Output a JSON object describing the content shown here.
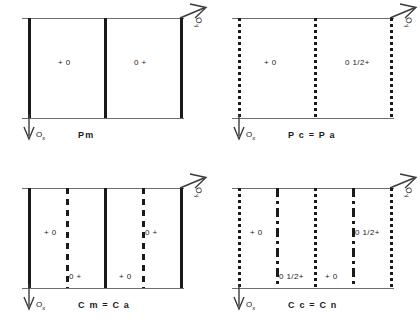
{
  "figure": {
    "axes": {
      "horizontal_label": "O",
      "horizontal_subscript": "y",
      "vertical_label": "O",
      "vertical_subscript": "x"
    },
    "line_colors": {
      "frame": "#6e6e6e",
      "symmetry_line": "#1a1a1a"
    }
  },
  "panels": [
    {
      "id": "panel-pm",
      "caption": "Pm",
      "lines": [
        {
          "style": "solid",
          "x": 6
        },
        {
          "style": "solid",
          "x": 82
        },
        {
          "style": "solid",
          "x": 158
        }
      ],
      "site_labels": [
        {
          "text": "+ 0",
          "x": 36,
          "y": 40
        },
        {
          "text": "0  +",
          "x": 112,
          "y": 40
        }
      ]
    },
    {
      "id": "panel-pc-pa",
      "caption": "P c = P a",
      "lines": [
        {
          "style": "dotted",
          "x": 6
        },
        {
          "style": "dotted",
          "x": 82
        },
        {
          "style": "dotted",
          "x": 158
        }
      ],
      "site_labels": [
        {
          "text": "+ 0",
          "x": 32,
          "y": 40
        },
        {
          "text": "0 1/2+",
          "x": 113,
          "y": 40
        }
      ]
    },
    {
      "id": "panel-cm-ca",
      "caption": "C m = C a",
      "lines": [
        {
          "style": "solid",
          "x": 6
        },
        {
          "style": "dashed",
          "x": 44
        },
        {
          "style": "solid",
          "x": 82
        },
        {
          "style": "dashed",
          "x": 120
        },
        {
          "style": "solid",
          "x": 158
        }
      ],
      "site_labels": [
        {
          "text": "+ 0",
          "x": 22,
          "y": 40
        },
        {
          "text": "0  +",
          "x": 47,
          "y": 84
        },
        {
          "text": "0  +",
          "x": 123,
          "y": 40
        },
        {
          "text": "+ 0",
          "x": 97,
          "y": 84
        }
      ]
    },
    {
      "id": "panel-cc-cn",
      "caption": "C c = C n",
      "lines": [
        {
          "style": "dotted",
          "x": 6
        },
        {
          "style": "dashdot",
          "x": 44
        },
        {
          "style": "dotted",
          "x": 82
        },
        {
          "style": "dashdot",
          "x": 120
        },
        {
          "style": "dotted",
          "x": 158
        }
      ],
      "site_labels": [
        {
          "text": "+ 0",
          "x": 18,
          "y": 40
        },
        {
          "text": "0 1/2+",
          "x": 47,
          "y": 84
        },
        {
          "text": "0 1/2+",
          "x": 123,
          "y": 40
        },
        {
          "text": "+ 0",
          "x": 93,
          "y": 84
        }
      ]
    }
  ]
}
